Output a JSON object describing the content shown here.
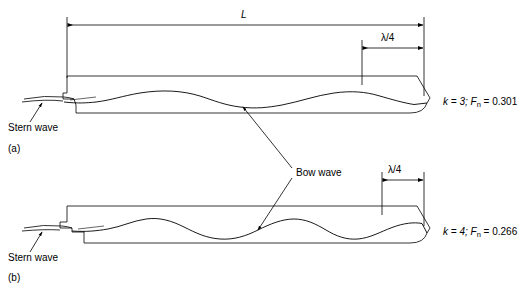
{
  "figure": {
    "type": "technical-line-diagram",
    "stroke_color": "#000000",
    "background_color": "#ffffff"
  },
  "panels": [
    {
      "id": "a",
      "panel_label": "(a)",
      "condition_label": "k = 3; F",
      "condition_sub": "n",
      "condition_value": " = 0.301",
      "k": 3,
      "froude_number": 0.301,
      "stern_wave_label": "Stern wave",
      "length_label": "L",
      "quarter_wave_label": "λ/4",
      "wave_crests": 3
    },
    {
      "id": "b",
      "panel_label": "(b)",
      "condition_label": "k = 4; F",
      "condition_sub": "n",
      "condition_value": " = 0.266",
      "k": 4,
      "froude_number": 0.266,
      "stern_wave_label": "Stern wave",
      "quarter_wave_label": "λ/4",
      "wave_crests": 4
    }
  ],
  "annotations": {
    "bow_wave_label": "Bow wave",
    "length_dimension": "L",
    "quarter_wavelength_dimension": "λ/4"
  }
}
